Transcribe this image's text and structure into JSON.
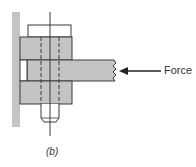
{
  "figure": {
    "caption": "(b)",
    "force_label": "Force",
    "colors": {
      "fill": "#c4c4c4",
      "stroke": "#3a3a3a",
      "background": "#ffffff"
    },
    "parts": [
      "wall-plate",
      "bolt-head",
      "upper-plate",
      "loaded-bar",
      "lower-plate",
      "nut-shank",
      "bolt-centerline",
      "force-arrow"
    ]
  }
}
